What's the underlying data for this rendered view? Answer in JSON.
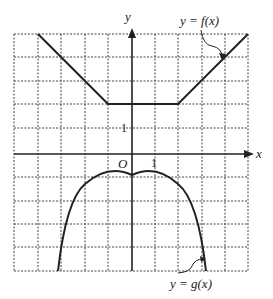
{
  "diagram": {
    "type": "function-graph",
    "axes": {
      "x_label": "x",
      "y_label": "y",
      "origin_label": "O",
      "unit_label_x": "1",
      "unit_label_y": "1"
    },
    "grid": {
      "x_range": [
        -5,
        5
      ],
      "y_range": [
        -6,
        5
      ],
      "step": 1,
      "style": "dashed"
    },
    "curves": [
      {
        "name": "f",
        "label": "y = f(x)",
        "kind": "piecewise-linear",
        "points": [
          [
            -4,
            5
          ],
          [
            -1,
            2
          ],
          [
            2,
            2
          ],
          [
            5,
            5
          ]
        ]
      },
      {
        "name": "g",
        "label": "y = g(x)",
        "kind": "parabola",
        "vertex": [
          0,
          -1
        ],
        "approx": "y = -x^2/2 - 1"
      }
    ]
  }
}
